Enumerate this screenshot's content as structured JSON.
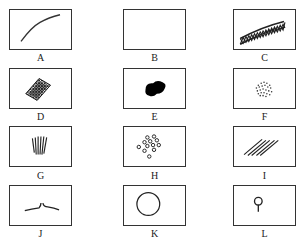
{
  "diagram": {
    "panels": [
      {
        "id": "A",
        "label": "A",
        "pattern": "single curved line"
      },
      {
        "id": "B",
        "label": "B",
        "pattern": "empty"
      },
      {
        "id": "C",
        "label": "C",
        "pattern": "curved lattice band"
      },
      {
        "id": "D",
        "label": "D",
        "pattern": "dense crosshatched patch"
      },
      {
        "id": "E",
        "label": "E",
        "pattern": "solid black blob"
      },
      {
        "id": "F",
        "label": "F",
        "pattern": "cluster of fine dots"
      },
      {
        "id": "G",
        "label": "G",
        "pattern": "fan of vertical lines"
      },
      {
        "id": "H",
        "label": "H",
        "pattern": "cluster of small rings"
      },
      {
        "id": "I",
        "label": "I",
        "pattern": "parallel diagonal lines"
      },
      {
        "id": "J",
        "label": "J",
        "pattern": "two short arcs meeting at a peak"
      },
      {
        "id": "K",
        "label": "K",
        "pattern": "single large circle"
      },
      {
        "id": "L",
        "label": "L",
        "pattern": "small ring on a stalk"
      }
    ]
  }
}
